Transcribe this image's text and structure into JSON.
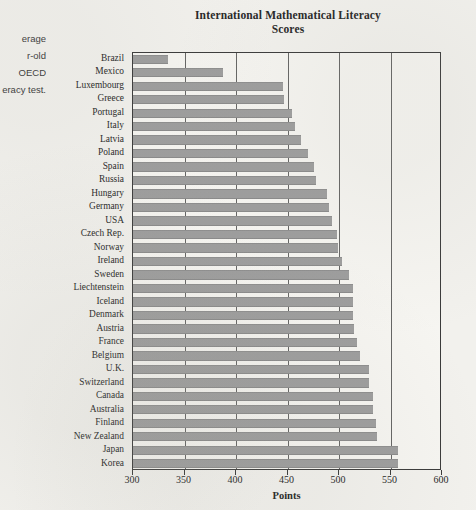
{
  "margin_note": {
    "lines": [
      "erage",
      "r-old",
      "OECD",
      "eracy test."
    ]
  },
  "chart_data": {
    "type": "bar",
    "orientation": "horizontal",
    "title_lines": [
      "International Mathematical Literacy",
      "Scores"
    ],
    "xlabel": "Points",
    "ylabel": "",
    "xlim": [
      300,
      600
    ],
    "xticks": [
      300,
      350,
      400,
      450,
      500,
      550,
      600
    ],
    "grid": true,
    "grid_axis": "x",
    "legend": false,
    "bar_color": "#9d9d9d",
    "categories": [
      "Brazil",
      "Mexico",
      "Luxembourg",
      "Greece",
      "Portugal",
      "Italy",
      "Latvia",
      "Poland",
      "Spain",
      "Russia",
      "Hungary",
      "Germany",
      "USA",
      "Czech Rep.",
      "Norway",
      "Ireland",
      "Sweden",
      "Liechtenstein",
      "Iceland",
      "Denmark",
      "Austria",
      "France",
      "Belgium",
      "U.K.",
      "Switzerland",
      "Canada",
      "Australia",
      "Finland",
      "New Zealand",
      "Japan",
      "Korea"
    ],
    "values": [
      334,
      387,
      446,
      447,
      454,
      457,
      463,
      470,
      476,
      478,
      488,
      490,
      493,
      498,
      499,
      503,
      510,
      514,
      514,
      514,
      515,
      517,
      520,
      529,
      529,
      533,
      533,
      536,
      537,
      557,
      557
    ]
  }
}
